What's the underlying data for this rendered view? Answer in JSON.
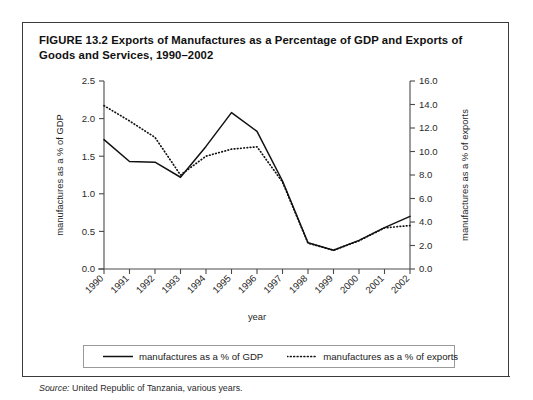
{
  "figure": {
    "number": "FIGURE 13.2",
    "title": "Exports of Manufactures as a Percentage of GDP and Exports of Goods and Services, 1990–2002"
  },
  "source": {
    "lead": "Source:",
    "text": " United Republic of Tanzania, various years."
  },
  "legend": {
    "items": [
      {
        "label": "manufactures as a % of GDP",
        "style": "solid",
        "color": "#111111"
      },
      {
        "label": "manufactures as a % of exports",
        "style": "dotted",
        "color": "#111111"
      }
    ]
  },
  "chart_data": {
    "type": "line",
    "title": "Exports of Manufactures as a Percentage of GDP and Exports of Goods and Services, 1990–2002",
    "xlabel": "year",
    "ylabel": "manufactures as a % of GDP",
    "y2label": "manufactures as a % of exports",
    "categories": [
      "1990",
      "1991",
      "1992",
      "1993",
      "1994",
      "1995",
      "1996",
      "1997",
      "1998",
      "1999",
      "2000",
      "2001",
      "2002"
    ],
    "ylim": [
      0.0,
      2.5
    ],
    "yticks": [
      "0.0",
      "0.5",
      "1.0",
      "1.5",
      "2.0",
      "2.5"
    ],
    "y2lim": [
      0.0,
      16.0
    ],
    "y2ticks": [
      "0.0",
      "2.0",
      "4.0",
      "6.0",
      "8.0",
      "10.0",
      "12.0",
      "14.0",
      "16.0"
    ],
    "grid": false,
    "legend_position": "below-plot",
    "series": [
      {
        "name": "manufactures as a % of GDP",
        "axis": "left",
        "style": "solid",
        "values": [
          1.72,
          1.43,
          1.42,
          1.22,
          1.63,
          2.08,
          1.83,
          1.17,
          0.35,
          0.25,
          0.38,
          0.55,
          0.7
        ]
      },
      {
        "name": "manufactures as a % of exports",
        "axis": "right",
        "style": "dotted",
        "values": [
          13.9,
          12.6,
          11.2,
          8.0,
          9.6,
          10.2,
          10.4,
          7.4,
          2.2,
          1.6,
          2.4,
          3.5,
          3.7
        ]
      }
    ]
  }
}
